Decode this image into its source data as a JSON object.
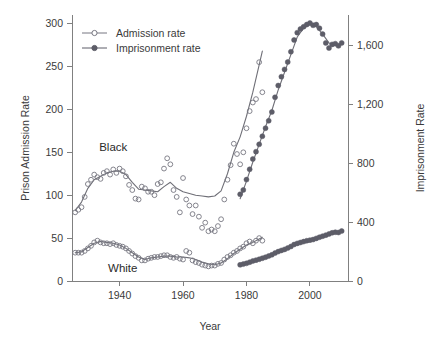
{
  "chart_data": {
    "type": "scatter",
    "title": "",
    "xlabel": "Year",
    "ylabel": "Prison Admission Rate",
    "y2label": "Imprisonment Rate",
    "xlim": [
      1925,
      2012
    ],
    "ylim": [
      0,
      310
    ],
    "y2lim": [
      0,
      1810
    ],
    "grid": false,
    "legend_position": "top-left",
    "xticks": [
      1940,
      1960,
      1980,
      2000
    ],
    "xtick_labels": [
      "1940",
      "1960",
      "1980",
      "2000"
    ],
    "yticks": [
      0,
      50,
      100,
      150,
      200,
      250,
      300
    ],
    "ytick_labels": [
      "0",
      "50",
      "100",
      "150",
      "200",
      "250",
      "300"
    ],
    "y2ticks": [
      0,
      400,
      800,
      1200,
      1600
    ],
    "y2tick_labels": [
      "0",
      "400",
      "800",
      "1,200",
      "1,600"
    ],
    "legend": [
      {
        "label": "Admission rate",
        "marker": "open-circle",
        "color": "#777781"
      },
      {
        "label": "Imprisonment rate",
        "marker": "filled-circle",
        "color": "#5d5d68"
      }
    ],
    "annotations": [
      {
        "text": "Black",
        "x": 1938,
        "y": 152
      },
      {
        "text": "White",
        "x": 1941,
        "y": 11
      }
    ],
    "series": [
      {
        "name": "Black admission rate",
        "axis": "left",
        "marker": "open-circle",
        "color": "#777781",
        "points": [
          [
            1926,
            80
          ],
          [
            1927,
            83
          ],
          [
            1928,
            86
          ],
          [
            1929,
            98
          ],
          [
            1930,
            113
          ],
          [
            1931,
            118
          ],
          [
            1932,
            124
          ],
          [
            1933,
            121
          ],
          [
            1934,
            119
          ],
          [
            1935,
            126
          ],
          [
            1936,
            128
          ],
          [
            1937,
            124
          ],
          [
            1938,
            130
          ],
          [
            1939,
            126
          ],
          [
            1940,
            131
          ],
          [
            1941,
            128
          ],
          [
            1942,
            122
          ],
          [
            1943,
            112
          ],
          [
            1944,
            106
          ],
          [
            1945,
            96
          ],
          [
            1946,
            95
          ],
          [
            1947,
            110
          ],
          [
            1948,
            108
          ],
          [
            1949,
            104
          ],
          [
            1950,
            104
          ],
          [
            1951,
            100
          ],
          [
            1952,
            113
          ],
          [
            1953,
            115
          ],
          [
            1954,
            131
          ],
          [
            1955,
            143
          ],
          [
            1956,
            136
          ],
          [
            1957,
            106
          ],
          [
            1958,
            98
          ],
          [
            1959,
            80
          ],
          [
            1960,
            120
          ],
          [
            1961,
            95
          ],
          [
            1962,
            88
          ],
          [
            1963,
            78
          ],
          [
            1964,
            88
          ],
          [
            1965,
            75
          ],
          [
            1966,
            62
          ],
          [
            1967,
            68
          ],
          [
            1968,
            58
          ],
          [
            1969,
            60
          ],
          [
            1970,
            58
          ],
          [
            1971,
            64
          ],
          [
            1972,
            72
          ],
          [
            1973,
            95
          ],
          [
            1974,
            118
          ],
          [
            1975,
            135
          ],
          [
            1976,
            160
          ],
          [
            1977,
            148
          ],
          [
            1978,
            136
          ],
          [
            1979,
            150
          ],
          [
            1980,
            178
          ],
          [
            1981,
            198
          ],
          [
            1982,
            208
          ],
          [
            1983,
            212
          ],
          [
            1984,
            255
          ],
          [
            1985,
            220
          ]
        ]
      },
      {
        "name": "Black imprisonment rate",
        "axis": "right",
        "marker": "filled-circle",
        "color": "#5d5d68",
        "points": [
          [
            1978,
            590
          ],
          [
            1979,
            620
          ],
          [
            1980,
            690
          ],
          [
            1981,
            760
          ],
          [
            1982,
            830
          ],
          [
            1983,
            880
          ],
          [
            1984,
            930
          ],
          [
            1985,
            985
          ],
          [
            1986,
            1040
          ],
          [
            1987,
            1090
          ],
          [
            1988,
            1150
          ],
          [
            1989,
            1250
          ],
          [
            1990,
            1330
          ],
          [
            1991,
            1390
          ],
          [
            1992,
            1440
          ],
          [
            1993,
            1490
          ],
          [
            1994,
            1560
          ],
          [
            1995,
            1640
          ],
          [
            1996,
            1690
          ],
          [
            1997,
            1715
          ],
          [
            1998,
            1730
          ],
          [
            1999,
            1745
          ],
          [
            2000,
            1755
          ],
          [
            2001,
            1740
          ],
          [
            2002,
            1745
          ],
          [
            2003,
            1720
          ],
          [
            2004,
            1680
          ],
          [
            2005,
            1620
          ],
          [
            2006,
            1585
          ],
          [
            2007,
            1610
          ],
          [
            2008,
            1615
          ],
          [
            2009,
            1600
          ],
          [
            2010,
            1620
          ]
        ]
      },
      {
        "name": "White admission rate",
        "axis": "left",
        "marker": "open-circle",
        "color": "#777781",
        "points": [
          [
            1926,
            33
          ],
          [
            1927,
            33
          ],
          [
            1928,
            33
          ],
          [
            1929,
            35
          ],
          [
            1930,
            38
          ],
          [
            1931,
            41
          ],
          [
            1932,
            45
          ],
          [
            1933,
            47
          ],
          [
            1934,
            45
          ],
          [
            1935,
            44
          ],
          [
            1936,
            44
          ],
          [
            1937,
            43
          ],
          [
            1938,
            44
          ],
          [
            1939,
            42
          ],
          [
            1940,
            41
          ],
          [
            1941,
            40
          ],
          [
            1942,
            38
          ],
          [
            1943,
            35
          ],
          [
            1944,
            32
          ],
          [
            1945,
            29
          ],
          [
            1946,
            27
          ],
          [
            1947,
            24
          ],
          [
            1948,
            24
          ],
          [
            1949,
            26
          ],
          [
            1950,
            27
          ],
          [
            1951,
            28
          ],
          [
            1952,
            28
          ],
          [
            1953,
            29
          ],
          [
            1954,
            30
          ],
          [
            1955,
            30
          ],
          [
            1956,
            28
          ],
          [
            1957,
            27
          ],
          [
            1958,
            28
          ],
          [
            1959,
            26
          ],
          [
            1960,
            25
          ],
          [
            1961,
            35
          ],
          [
            1962,
            33
          ],
          [
            1963,
            24
          ],
          [
            1964,
            22
          ],
          [
            1965,
            21
          ],
          [
            1966,
            19
          ],
          [
            1967,
            18
          ],
          [
            1968,
            17
          ],
          [
            1969,
            18
          ],
          [
            1970,
            18
          ],
          [
            1971,
            20
          ],
          [
            1972,
            21
          ],
          [
            1973,
            25
          ],
          [
            1974,
            28
          ],
          [
            1975,
            30
          ],
          [
            1976,
            33
          ],
          [
            1977,
            35
          ],
          [
            1978,
            38
          ],
          [
            1979,
            40
          ],
          [
            1980,
            44
          ],
          [
            1981,
            46
          ],
          [
            1982,
            44
          ],
          [
            1983,
            47
          ],
          [
            1984,
            50
          ],
          [
            1985,
            47
          ]
        ]
      },
      {
        "name": "White imprisonment rate",
        "axis": "right",
        "marker": "filled-circle",
        "color": "#5d5d68",
        "points": [
          [
            1978,
            110
          ],
          [
            1979,
            115
          ],
          [
            1980,
            120
          ],
          [
            1981,
            128
          ],
          [
            1982,
            136
          ],
          [
            1983,
            142
          ],
          [
            1984,
            148
          ],
          [
            1985,
            155
          ],
          [
            1986,
            162
          ],
          [
            1987,
            170
          ],
          [
            1988,
            178
          ],
          [
            1989,
            190
          ],
          [
            1990,
            200
          ],
          [
            1991,
            208
          ],
          [
            1992,
            215
          ],
          [
            1993,
            224
          ],
          [
            1994,
            235
          ],
          [
            1995,
            248
          ],
          [
            1996,
            256
          ],
          [
            1997,
            262
          ],
          [
            1998,
            268
          ],
          [
            1999,
            274
          ],
          [
            2000,
            278
          ],
          [
            2001,
            282
          ],
          [
            2002,
            290
          ],
          [
            2003,
            298
          ],
          [
            2004,
            305
          ],
          [
            2005,
            312
          ],
          [
            2006,
            320
          ],
          [
            2007,
            328
          ],
          [
            2008,
            332
          ],
          [
            2009,
            330
          ],
          [
            2010,
            340
          ]
        ]
      }
    ],
    "smooth_curves": [
      {
        "name": "Black admission smooth",
        "axis": "left",
        "points": [
          [
            1926,
            82
          ],
          [
            1928,
            92
          ],
          [
            1930,
            108
          ],
          [
            1932,
            118
          ],
          [
            1934,
            122
          ],
          [
            1936,
            126
          ],
          [
            1938,
            128
          ],
          [
            1940,
            128
          ],
          [
            1942,
            124
          ],
          [
            1944,
            115
          ],
          [
            1946,
            107
          ],
          [
            1948,
            106
          ],
          [
            1950,
            105
          ],
          [
            1952,
            104
          ],
          [
            1954,
            110
          ],
          [
            1956,
            115
          ],
          [
            1958,
            108
          ],
          [
            1960,
            104
          ],
          [
            1962,
            102
          ],
          [
            1964,
            100
          ],
          [
            1966,
            99
          ],
          [
            1968,
            98
          ],
          [
            1970,
            99
          ],
          [
            1972,
            105
          ],
          [
            1974,
            125
          ],
          [
            1976,
            150
          ],
          [
            1978,
            168
          ],
          [
            1980,
            192
          ],
          [
            1982,
            220
          ],
          [
            1984,
            252
          ],
          [
            1985,
            268
          ]
        ]
      },
      {
        "name": "Black imprisonment smooth",
        "axis": "right",
        "points": [
          [
            1978,
            560
          ],
          [
            1980,
            680
          ],
          [
            1982,
            810
          ],
          [
            1984,
            930
          ],
          [
            1986,
            1050
          ],
          [
            1988,
            1160
          ],
          [
            1990,
            1300
          ],
          [
            1992,
            1420
          ],
          [
            1994,
            1540
          ],
          [
            1996,
            1660
          ],
          [
            1998,
            1720
          ],
          [
            2000,
            1745
          ],
          [
            2002,
            1730
          ],
          [
            2004,
            1680
          ],
          [
            2006,
            1620
          ],
          [
            2008,
            1605
          ],
          [
            2010,
            1615
          ]
        ]
      },
      {
        "name": "White admission smooth",
        "axis": "left",
        "points": [
          [
            1926,
            33
          ],
          [
            1928,
            34
          ],
          [
            1930,
            39
          ],
          [
            1932,
            44
          ],
          [
            1934,
            46
          ],
          [
            1936,
            45
          ],
          [
            1938,
            44
          ],
          [
            1940,
            42
          ],
          [
            1942,
            38
          ],
          [
            1944,
            33
          ],
          [
            1946,
            28
          ],
          [
            1948,
            25
          ],
          [
            1950,
            27
          ],
          [
            1952,
            28
          ],
          [
            1954,
            29
          ],
          [
            1956,
            29
          ],
          [
            1958,
            28
          ],
          [
            1960,
            28
          ],
          [
            1962,
            27
          ],
          [
            1964,
            25
          ],
          [
            1966,
            22
          ],
          [
            1968,
            20
          ],
          [
            1970,
            19
          ],
          [
            1972,
            21
          ],
          [
            1974,
            26
          ],
          [
            1976,
            32
          ],
          [
            1978,
            37
          ],
          [
            1980,
            42
          ],
          [
            1982,
            45
          ],
          [
            1984,
            49
          ],
          [
            1985,
            51
          ]
        ]
      },
      {
        "name": "White imprisonment smooth",
        "axis": "right",
        "points": [
          [
            1978,
            112
          ],
          [
            1980,
            122
          ],
          [
            1982,
            135
          ],
          [
            1984,
            148
          ],
          [
            1986,
            163
          ],
          [
            1988,
            178
          ],
          [
            1990,
            200
          ],
          [
            1992,
            216
          ],
          [
            1994,
            236
          ],
          [
            1996,
            256
          ],
          [
            1998,
            268
          ],
          [
            2000,
            279
          ],
          [
            2002,
            290
          ],
          [
            2004,
            305
          ],
          [
            2006,
            320
          ],
          [
            2008,
            331
          ],
          [
            2010,
            340
          ]
        ]
      }
    ]
  },
  "axes": {
    "left_title": "Prison Admission Rate",
    "right_title": "Imprisonment Rate",
    "bottom_title": "Year"
  },
  "legend": {
    "item1_label": "Admission rate",
    "item2_label": "Imprisonment rate"
  },
  "labels": {
    "black": "Black",
    "white": "White"
  },
  "colors": {
    "open_marker": "#777781",
    "filled_marker": "#5d5d68",
    "axis": "#808080",
    "text": "#3a3a3a",
    "background": "#ffffff"
  }
}
